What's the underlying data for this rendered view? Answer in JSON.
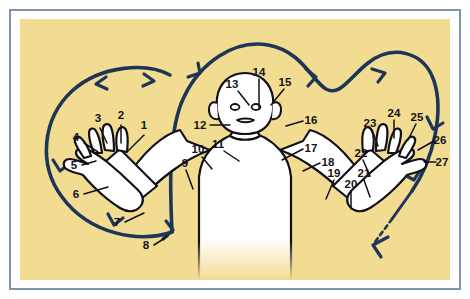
{
  "figure": {
    "background_color": "#f2dc92",
    "frame_color": "#7e95ad",
    "body_fill": "#ffffff",
    "outline_color": "#111018",
    "flow_line_color": "#1d3557",
    "label_color": "#16121a"
  },
  "flow": {
    "description": "Continuous dark navy looping path (left loop and right heart lobe) with directional arrowheads indicating movement, terminating in a dashed arrow at lower right",
    "arrow_count": 9,
    "dashed_terminal": true
  },
  "labels": [
    {
      "id": "1",
      "text": "1",
      "x": 124,
      "y": 110
    },
    {
      "id": "2",
      "text": "2",
      "x": 101,
      "y": 100
    },
    {
      "id": "3",
      "text": "3",
      "x": 78,
      "y": 103
    },
    {
      "id": "4",
      "text": "4",
      "x": 56,
      "y": 122
    },
    {
      "id": "5",
      "text": "5",
      "x": 54,
      "y": 148
    },
    {
      "id": "6",
      "text": "6",
      "x": 56,
      "y": 177
    },
    {
      "id": "7",
      "text": "7",
      "x": 97,
      "y": 206
    },
    {
      "id": "8",
      "text": "8",
      "x": 126,
      "y": 229
    },
    {
      "id": "9",
      "text": "9",
      "x": 165,
      "y": 145
    },
    {
      "id": "10",
      "text": "10",
      "x": 176,
      "y": 134
    },
    {
      "id": "11",
      "text": "11",
      "x": 196,
      "y": 129
    },
    {
      "id": "12",
      "text": "12",
      "x": 180,
      "y": 109
    },
    {
      "id": "13",
      "text": "13",
      "x": 212,
      "y": 66
    },
    {
      "id": "14",
      "text": "14",
      "x": 238,
      "y": 53
    },
    {
      "id": "15",
      "text": "15",
      "x": 265,
      "y": 63
    },
    {
      "id": "16",
      "text": "16",
      "x": 288,
      "y": 101
    },
    {
      "id": "17",
      "text": "17",
      "x": 288,
      "y": 127
    },
    {
      "id": "18",
      "text": "18",
      "x": 303,
      "y": 140
    },
    {
      "id": "19",
      "text": "19",
      "x": 312,
      "y": 155
    },
    {
      "id": "20",
      "text": "20",
      "x": 327,
      "y": 166
    },
    {
      "id": "21",
      "text": "21",
      "x": 341,
      "y": 155
    },
    {
      "id": "22",
      "text": "22",
      "x": 337,
      "y": 135
    },
    {
      "id": "23",
      "text": "23",
      "x": 348,
      "y": 105
    },
    {
      "id": "24",
      "text": "24",
      "x": 373,
      "y": 95
    },
    {
      "id": "25",
      "text": "25",
      "x": 396,
      "y": 99
    },
    {
      "id": "26",
      "text": "26",
      "x": 420,
      "y": 120
    },
    {
      "id": "27",
      "text": "27",
      "x": 422,
      "y": 145
    }
  ]
}
